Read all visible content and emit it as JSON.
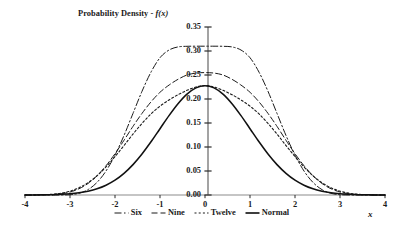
{
  "chart_data": {
    "type": "line",
    "title_prefix": "Probability Density - ",
    "title_fn": "f",
    "title_arg": "(x)",
    "xlabel": "x",
    "ylabel": "",
    "xlim": [
      -4,
      4
    ],
    "ylim": [
      0,
      0.35
    ],
    "grid": false,
    "legend_position": "bottom-center",
    "xticks": [
      -4,
      -3,
      -2,
      -1,
      0,
      1,
      2,
      3,
      4
    ],
    "xtick_labels": [
      "-4",
      "-3",
      "-2",
      "-1",
      "0",
      "1",
      "2",
      "3",
      "4"
    ],
    "yticks": [
      0.0,
      0.05,
      0.1,
      0.15,
      0.2,
      0.25,
      0.3,
      0.35
    ],
    "ytick_labels": [
      "0.00",
      "0.05",
      "0.10",
      "0.15",
      "0.20",
      "0.25",
      "0.30",
      "0.35"
    ],
    "x": [
      -4.0,
      -3.8,
      -3.6,
      -3.4,
      -3.2,
      -3.0,
      -2.8,
      -2.6,
      -2.4,
      -2.2,
      -2.0,
      -1.8,
      -1.6,
      -1.4,
      -1.2,
      -1.0,
      -0.8,
      -0.6,
      -0.4,
      -0.2,
      0.0,
      0.2,
      0.4,
      0.6,
      0.8,
      1.0,
      1.2,
      1.4,
      1.6,
      1.8,
      2.0,
      2.2,
      2.4,
      2.6,
      2.8,
      3.0,
      3.2,
      3.4,
      3.6,
      3.8,
      4.0
    ],
    "series": [
      {
        "name": "Six",
        "label": "Six",
        "linestyle": "dashdot",
        "color": "#1a1a1a",
        "peak": 0.31,
        "values": [
          0.0,
          0.0,
          0.0,
          0.0,
          0.0,
          0.0006,
          0.0035,
          0.0112,
          0.0262,
          0.05,
          0.083,
          0.124,
          0.17,
          0.216,
          0.256,
          0.286,
          0.302,
          0.3085,
          0.3098,
          0.31,
          0.31,
          0.31,
          0.3098,
          0.3085,
          0.302,
          0.286,
          0.256,
          0.216,
          0.17,
          0.124,
          0.083,
          0.05,
          0.0262,
          0.0112,
          0.0035,
          0.0006,
          0.0,
          0.0,
          0.0,
          0.0,
          0.0
        ]
      },
      {
        "name": "Nine",
        "label": "Nine",
        "linestyle": "dashed",
        "color": "#1a1a1a",
        "peak": 0.255,
        "values": [
          0.0,
          0.0,
          0.0002,
          0.0008,
          0.0025,
          0.0062,
          0.013,
          0.024,
          0.04,
          0.061,
          0.086,
          0.114,
          0.143,
          0.17,
          0.194,
          0.214,
          0.229,
          0.241,
          0.25,
          0.254,
          0.255,
          0.254,
          0.25,
          0.241,
          0.229,
          0.214,
          0.194,
          0.17,
          0.143,
          0.114,
          0.086,
          0.061,
          0.04,
          0.024,
          0.013,
          0.0062,
          0.0025,
          0.0008,
          0.0002,
          0.0,
          0.0
        ]
      },
      {
        "name": "Twelve",
        "label": "Twelve",
        "linestyle": "dotted",
        "color": "#1a1a1a",
        "peak": 0.228,
        "values": [
          0.0,
          0.0002,
          0.0006,
          0.0016,
          0.0038,
          0.008,
          0.015,
          0.0255,
          0.04,
          0.0585,
          0.08,
          0.103,
          0.127,
          0.149,
          0.169,
          0.185,
          0.198,
          0.209,
          0.218,
          0.225,
          0.228,
          0.225,
          0.218,
          0.209,
          0.198,
          0.185,
          0.169,
          0.149,
          0.127,
          0.103,
          0.08,
          0.0585,
          0.04,
          0.0255,
          0.015,
          0.008,
          0.0038,
          0.0016,
          0.0006,
          0.0002,
          0.0
        ]
      },
      {
        "name": "Normal",
        "label": "Normal",
        "linestyle": "solid",
        "color": "#111111",
        "peak": 0.2275,
        "values": [
          0.0001,
          0.0003,
          0.0006,
          0.0012,
          0.0024,
          0.0044,
          0.0079,
          0.0136,
          0.0224,
          0.0355,
          0.054,
          0.079,
          0.1109,
          0.1497,
          0.1942,
          0.242,
          0.2897,
          0.3332,
          0.3683,
          0.391,
          0.3989,
          0.391,
          0.3683,
          0.3332,
          0.2897,
          0.242,
          0.1942,
          0.1497,
          0.1109,
          0.079,
          0.054,
          0.0355,
          0.0224,
          0.0136,
          0.0079,
          0.0044,
          0.0024,
          0.0012,
          0.0006,
          0.0003,
          0.0001
        ],
        "values_scaled": [
          0.0001,
          0.0002,
          0.0004,
          0.0007,
          0.0014,
          0.0025,
          0.0045,
          0.0078,
          0.0128,
          0.0203,
          0.0308,
          0.0451,
          0.0633,
          0.0854,
          0.1108,
          0.1381,
          0.1653,
          0.1901,
          0.2101,
          0.2231,
          0.2275,
          0.2231,
          0.2101,
          0.1901,
          0.1653,
          0.1381,
          0.1108,
          0.0854,
          0.0633,
          0.0451,
          0.0308,
          0.0203,
          0.0128,
          0.0078,
          0.0045,
          0.0025,
          0.0014,
          0.0007,
          0.0004,
          0.0002,
          0.0001
        ]
      }
    ]
  },
  "legend": {
    "entries": [
      {
        "label": "Six",
        "style": "dashdot"
      },
      {
        "label": "Nine",
        "style": "dashed"
      },
      {
        "label": "Twelve",
        "style": "dotted"
      },
      {
        "label": "Normal",
        "style": "solid"
      }
    ]
  },
  "colors": {
    "axis": "#8c8c8c",
    "tick": "#2b2b2b",
    "curve": "#1a1a1a",
    "background": "#ffffff"
  }
}
